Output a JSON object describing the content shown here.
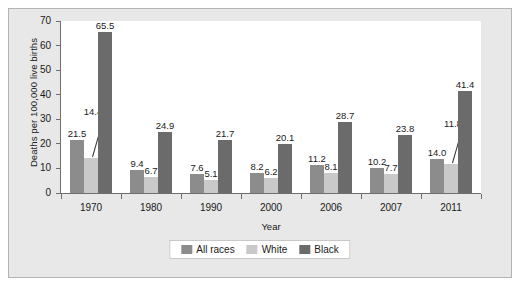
{
  "chart_data": {
    "type": "bar",
    "title": "",
    "subtitle": "",
    "xlabel": "Year",
    "ylabel": "Deaths per 100,000 live births",
    "ylim": [
      0,
      70
    ],
    "yticks": [
      0,
      10,
      20,
      30,
      40,
      50,
      60,
      70
    ],
    "grid": false,
    "legend_position": "bottom",
    "categories": [
      "1970",
      "1980",
      "1990",
      "2000",
      "2006",
      "2007",
      "2011"
    ],
    "series": [
      {
        "name": "All races",
        "color": "#8c8c8c",
        "values": [
          21.5,
          9.4,
          7.6,
          8.2,
          11.2,
          10.2,
          14.0
        ],
        "labels": [
          "21.5",
          "9.4",
          "7.6",
          "8.2",
          "11.2",
          "10.2",
          "14.0"
        ]
      },
      {
        "name": "White",
        "color": "#c9c9c9",
        "values": [
          14.4,
          6.7,
          5.1,
          6.2,
          8.1,
          7.7,
          11.8
        ],
        "labels": [
          "14.4",
          "6.7",
          "5.1",
          "6.2",
          "8.1",
          "7.7",
          "11.8"
        ]
      },
      {
        "name": "Black",
        "color": "#6b6b6b",
        "values": [
          65.5,
          24.9,
          21.7,
          20.1,
          28.7,
          23.8,
          41.4
        ],
        "labels": [
          "65.5",
          "24.9",
          "21.7",
          "20.1",
          "28.7",
          "23.8",
          "41.4"
        ]
      }
    ],
    "annotations": [
      {
        "category": "1970",
        "series": "White",
        "label": "14.4",
        "leader_line": true
      },
      {
        "category": "2011",
        "series": "White",
        "label": "11.8",
        "leader_line": true
      }
    ]
  },
  "legend": {
    "items": [
      {
        "label": "All races",
        "color": "#8c8c8c"
      },
      {
        "label": "White",
        "color": "#c9c9c9"
      },
      {
        "label": "Black",
        "color": "#6b6b6b"
      }
    ]
  },
  "colors": {
    "figure_background": "#e8e8e8",
    "plot_background": "#ffffff",
    "axis": "#6e6e6e",
    "text": "#1a1a1a",
    "border": "#b4b4b4"
  }
}
